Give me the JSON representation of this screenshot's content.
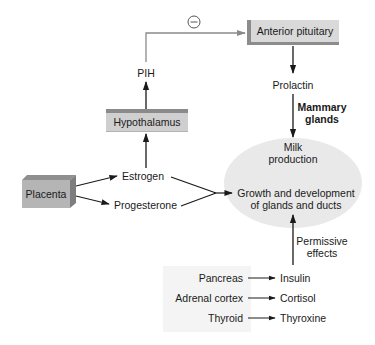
{
  "diagram": {
    "nodes": {
      "anterior_pituitary": "Anterior pituitary",
      "hypothalamus": "Hypothalamus",
      "placenta": "Placenta",
      "pih": "PIH",
      "prolactin": "Prolactin",
      "estrogen": "Estrogen",
      "progesterone": "Progesterone",
      "mammary_glands_line1": "Mammary",
      "mammary_glands_line2": "glands",
      "milk_production_line1": "Milk",
      "milk_production_line2": "production",
      "growth_line1": "Growth and development",
      "growth_line2": "of glands and ducts",
      "permissive_line1": "Permissive",
      "permissive_line2": "effects"
    },
    "inhibition_symbol": "⊖",
    "permissive_sources": [
      {
        "source": "Pancreas",
        "hormone": "Insulin"
      },
      {
        "source": "Adrenal cortex",
        "hormone": "Cortisol"
      },
      {
        "source": "Thyroid",
        "hormone": "Thyroxine"
      }
    ],
    "edges": [
      {
        "from": "Hypothalamus",
        "to": "PIH"
      },
      {
        "from": "PIH",
        "to": "Anterior pituitary",
        "type": "inhibitory"
      },
      {
        "from": "Anterior pituitary",
        "to": "Prolactin"
      },
      {
        "from": "Prolactin",
        "to": "Milk production",
        "label": "Mammary glands"
      },
      {
        "from": "Placenta",
        "to": "Estrogen"
      },
      {
        "from": "Placenta",
        "to": "Progesterone"
      },
      {
        "from": "Estrogen",
        "to": "Hypothalamus"
      },
      {
        "from": "Estrogen",
        "to": "Growth and development of glands and ducts"
      },
      {
        "from": "Progesterone",
        "to": "Growth and development of glands and ducts"
      },
      {
        "from": "Pancreas",
        "to": "Insulin"
      },
      {
        "from": "Adrenal cortex",
        "to": "Cortisol"
      },
      {
        "from": "Thyroid",
        "to": "Thyroxine"
      },
      {
        "from": "Insulin/Cortisol/Thyroxine",
        "to": "Growth and development of glands and ducts",
        "label": "Permissive effects"
      }
    ],
    "colors": {
      "box_fill": "#d9d9d9",
      "box_edge": "#8c8c8c",
      "ellipse_fill": "#e9e9e9",
      "inhibitory_line": "#8a8a8a",
      "arrow": "#1a1a1a"
    }
  }
}
